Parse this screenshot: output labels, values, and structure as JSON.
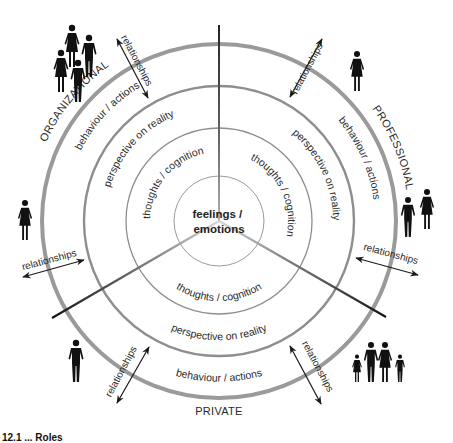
{
  "diagram": {
    "center_label": [
      "feelings /",
      "emotions"
    ],
    "rings": [
      {
        "name": "thoughts",
        "label": "thoughts / cognition"
      },
      {
        "name": "perspective",
        "label": "perspective on reality"
      },
      {
        "name": "behaviour",
        "label": "behaviour / actions"
      }
    ],
    "segments": [
      {
        "name": "organizational",
        "label": "ORGANIZATIONAL",
        "people": "group of four"
      },
      {
        "name": "professional",
        "label": "PROFESSIONAL",
        "people": "single woman; man and woman"
      },
      {
        "name": "private",
        "label": "PRIVATE",
        "people": "single man; family of four"
      }
    ],
    "relationship_label": "relationships",
    "caption_partial": "12.1 ... Roles"
  },
  "colors": {
    "ring_outer": "#9a9a9a",
    "ring_inner": "#8c8c8c",
    "divider": "#1a1a1a",
    "text": "#2a2a2a",
    "figure": "#111111"
  }
}
